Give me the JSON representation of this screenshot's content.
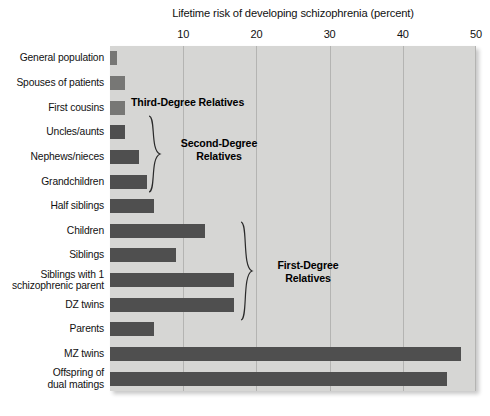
{
  "chart_data": {
    "type": "bar",
    "orientation": "horizontal",
    "title": "Lifetime risk of developing schizophrenia (percent)",
    "xlabel": "Lifetime risk of developing schizophrenia (percent)",
    "ylabel": "",
    "xlim": [
      0,
      50
    ],
    "xticks": [
      0,
      10,
      20,
      30,
      40,
      50
    ],
    "xtick_labels": [
      "",
      "10",
      "20",
      "30",
      "40",
      "50"
    ],
    "grid": true,
    "legend": false,
    "categories": [
      "General population",
      "Spouses of patients",
      "First cousins",
      "Uncles/aunts",
      "Nephews/nieces",
      "Grandchildren",
      "Half siblings",
      "Children",
      "Siblings",
      "Siblings with 1 schizophrenic parent",
      "DZ twins",
      "Parents",
      "MZ twins",
      "Offspring of dual matings"
    ],
    "values": [
      1,
      2,
      2,
      2,
      4,
      5,
      6,
      13,
      9,
      17,
      17,
      6,
      48,
      46
    ],
    "bar_colors": [
      "#777775",
      "#777775",
      "#777775",
      "#4f4f4f",
      "#4f4f4f",
      "#4f4f4f",
      "#4f4f4f",
      "#4f4f4f",
      "#4f4f4f",
      "#4f4f4f",
      "#4f4f4f",
      "#4f4f4f",
      "#4f4f4f",
      "#4f4f4f"
    ],
    "annotations": [
      {
        "text": "Third-Degree Relatives",
        "covers": [
          "First cousins"
        ]
      },
      {
        "text": "Second-Degree Relatives",
        "covers": [
          "Uncles/aunts",
          "Nephews/nieces",
          "Grandchildren",
          "Half siblings"
        ]
      },
      {
        "text": "First-Degree Relatives",
        "covers": [
          "Children",
          "Siblings",
          "Siblings with 1 schizophrenic parent",
          "DZ twins",
          "Parents"
        ]
      }
    ],
    "plot_background": "#d6d6d4",
    "gridline_color": "#b4b4b2"
  },
  "axis": {
    "ticks": [
      {
        "label": "10",
        "value": 10
      },
      {
        "label": "20",
        "value": 20
      },
      {
        "label": "30",
        "value": 30
      },
      {
        "label": "40",
        "value": 40
      },
      {
        "label": "50",
        "value": 50
      }
    ]
  },
  "category_labels": [
    {
      "line1": "General population",
      "line2": ""
    },
    {
      "line1": "Spouses of patients",
      "line2": ""
    },
    {
      "line1": "First cousins",
      "line2": ""
    },
    {
      "line1": "Uncles/aunts",
      "line2": ""
    },
    {
      "line1": "Nephews/nieces",
      "line2": ""
    },
    {
      "line1": "Grandchildren",
      "line2": ""
    },
    {
      "line1": "Half siblings",
      "line2": ""
    },
    {
      "line1": "Children",
      "line2": ""
    },
    {
      "line1": "Siblings",
      "line2": ""
    },
    {
      "line1": "Siblings with 1",
      "line2": "schizophrenic parent"
    },
    {
      "line1": "DZ twins",
      "line2": ""
    },
    {
      "line1": "Parents",
      "line2": ""
    },
    {
      "line1": "MZ twins",
      "line2": ""
    },
    {
      "line1": "Offspring of",
      "line2": "dual matings"
    }
  ],
  "annotations": {
    "third_degree": "Third-Degree Relatives",
    "second_degree_line1": "Second-Degree",
    "second_degree_line2": "Relatives",
    "first_degree_line1": "First-Degree",
    "first_degree_line2": "Relatives"
  }
}
